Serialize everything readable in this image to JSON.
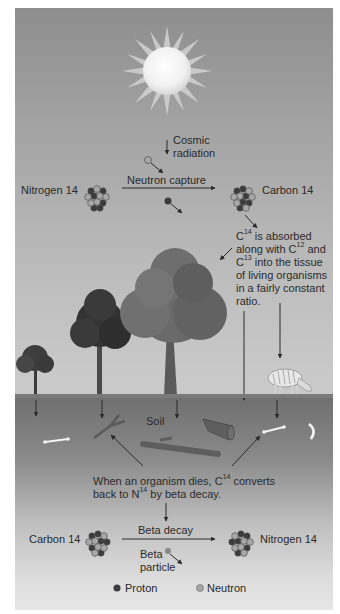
{
  "diagram": {
    "formation": {
      "cosmic_radiation_line1": "Cosmic",
      "cosmic_radiation_line2": "radiation",
      "reactant": "Nitrogen 14",
      "process": "Neutron capture",
      "product": "Carbon 14"
    },
    "absorption_note": {
      "p1": "C",
      "s1": "14",
      "p2": " is absorbed along with C",
      "s2": "12",
      "p3": " and C",
      "s3": "13",
      "p4": " into the tissue of living organisms in a fairly constant ratio."
    },
    "soil_label": "Soil",
    "decay_note": {
      "p1": "When an organism dies, C",
      "s1": "14",
      "p2": " converts back to N",
      "s2": "14",
      "p3": " by beta decay."
    },
    "decay": {
      "reactant": "Carbon 14",
      "process": "Beta decay",
      "emitted_line1": "Beta",
      "emitted_line2": "particle",
      "product": "Nitrogen 14"
    },
    "legend": [
      {
        "label": "Proton",
        "color": "#3c3c3c"
      },
      {
        "label": "Neutron",
        "color": "#a8a8a8"
      }
    ]
  }
}
